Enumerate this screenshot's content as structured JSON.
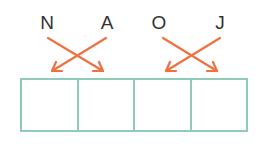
{
  "letters": [
    "N",
    "A",
    "O",
    "J"
  ],
  "arrows": [
    {
      "from_letter": "N",
      "to_box": 2
    },
    {
      "from_letter": "A",
      "to_box": 1
    },
    {
      "from_letter": "O",
      "to_box": 4
    },
    {
      "from_letter": "J",
      "to_box": 3
    }
  ],
  "boxes": [
    "",
    "",
    "",
    ""
  ],
  "colors": {
    "arrow": "#f07040",
    "box_border": "#8fcbb6",
    "text": "#333333"
  }
}
